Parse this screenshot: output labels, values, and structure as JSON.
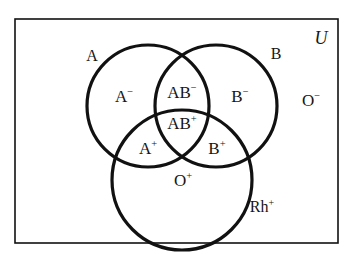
{
  "diagram": {
    "type": "venn-diagram",
    "universe_label": "U",
    "background_color": "#ffffff",
    "stroke_color": "#111111",
    "text_color": "#161616",
    "frame": {
      "name": "universal-set-rectangle",
      "x": 15,
      "y": 19,
      "width": 323,
      "height": 224,
      "stroke_width": 1.6
    },
    "circles": [
      {
        "id": "A",
        "label": "A",
        "cx": 148,
        "cy": 106,
        "r": 61,
        "stroke_width": 3.2
      },
      {
        "id": "B",
        "label": "B",
        "cx": 216,
        "cy": 106,
        "r": 61,
        "stroke_width": 3.2
      },
      {
        "id": "Rh",
        "label": "Rh",
        "cx": 182,
        "cy": 180,
        "r": 70,
        "stroke_width": 3.2
      }
    ],
    "set_labels": [
      {
        "name": "circle-label-a",
        "text": "A",
        "sup": "",
        "x": 92,
        "y": 56
      },
      {
        "name": "circle-label-b",
        "text": "B",
        "sup": "",
        "x": 276,
        "y": 54
      },
      {
        "name": "circle-label-rh",
        "text": "Rh",
        "sup": "+",
        "x": 262,
        "y": 207
      }
    ],
    "universe": {
      "name": "universe-label",
      "text": "U",
      "x": 321,
      "y": 38
    },
    "regions": [
      {
        "name": "region-a-negative",
        "text": "A",
        "sup": "-",
        "x": 124,
        "y": 96,
        "desc": "A only"
      },
      {
        "name": "region-ab-negative",
        "text": "AB",
        "sup": "-",
        "x": 182,
        "y": 92,
        "desc": "A and B, not Rh"
      },
      {
        "name": "region-b-negative",
        "text": "B",
        "sup": "-",
        "x": 240,
        "y": 96,
        "desc": "B only"
      },
      {
        "name": "region-o-negative",
        "text": "O",
        "sup": "-",
        "x": 311,
        "y": 100,
        "desc": "outside all circles"
      },
      {
        "name": "region-ab-positive",
        "text": "AB",
        "sup": "+",
        "x": 182,
        "y": 123,
        "desc": "A, B and Rh"
      },
      {
        "name": "region-a-positive",
        "text": "A",
        "sup": "+",
        "x": 148,
        "y": 148,
        "desc": "A and Rh"
      },
      {
        "name": "region-b-positive",
        "text": "B",
        "sup": "+",
        "x": 217,
        "y": 148,
        "desc": "B and Rh"
      },
      {
        "name": "region-o-positive",
        "text": "O",
        "sup": "+",
        "x": 183,
        "y": 180,
        "desc": "Rh only"
      }
    ]
  }
}
